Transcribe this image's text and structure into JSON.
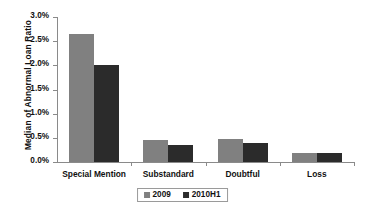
{
  "chart_data": {
    "type": "bar",
    "title": "",
    "xlabel": "",
    "ylabel": "Median of Abnormal Loan Ratio",
    "categories": [
      "Special Mention",
      "Substandard",
      "Doubtful",
      "Loss"
    ],
    "series": [
      {
        "name": "2009",
        "color": "#808080",
        "values": [
          2.65,
          0.455,
          0.48,
          0.18
        ]
      },
      {
        "name": "2010H1",
        "color": "#2b2b2b",
        "values": [
          2.0,
          0.35,
          0.39,
          0.18
        ]
      }
    ],
    "ylim": [
      0,
      3.0
    ],
    "ytick_values": [
      0.0,
      0.5,
      1.0,
      1.5,
      2.0,
      2.5,
      3.0
    ],
    "ytick_labels": [
      "0.0%",
      "0.5%",
      "1.0%",
      "1.5%",
      "2.0%",
      "2.5%",
      "3.0%"
    ],
    "grid": false,
    "legend_position": "bottom",
    "value_unit": "%"
  }
}
